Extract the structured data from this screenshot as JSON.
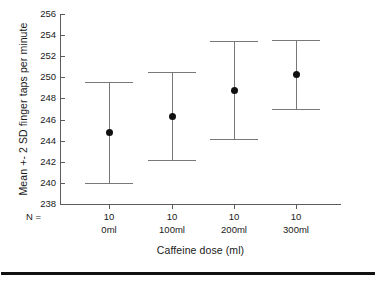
{
  "chart_data": {
    "type": "scatter",
    "title": "",
    "subtitle": "",
    "xlabel": "Caffeine dose (ml)",
    "ylabel": "Mean +- 2 SD finger taps per minute",
    "categories": [
      "0ml",
      "100ml",
      "200ml",
      "300ml"
    ],
    "n_label": "N =",
    "n_values": [
      "10",
      "10",
      "10",
      "10"
    ],
    "ylim": [
      238,
      256
    ],
    "ytick_labels": [
      "238",
      "240",
      "242",
      "244",
      "246",
      "248",
      "250",
      "252",
      "254",
      "256"
    ],
    "ytick_values": [
      238,
      240,
      242,
      244,
      246,
      248,
      250,
      252,
      254,
      256
    ],
    "ytick_step": 2,
    "grid": false,
    "legend": "none",
    "error_kind": "mean +- 2 SD",
    "series": [
      {
        "name": "Mean +- 2 SD finger taps per minute",
        "points": [
          {
            "category": "0ml",
            "mean": 244.8,
            "lower": 240.0,
            "upper": 249.6,
            "n": 10
          },
          {
            "category": "100ml",
            "mean": 246.3,
            "lower": 242.2,
            "upper": 250.5,
            "n": 10
          },
          {
            "category": "200ml",
            "mean": 248.8,
            "lower": 244.2,
            "upper": 253.4,
            "n": 10
          },
          {
            "category": "300ml",
            "mean": 250.3,
            "lower": 247.0,
            "upper": 253.5,
            "n": 10
          }
        ]
      }
    ],
    "colors": {
      "marker": "#101010",
      "error_line": "#787878",
      "axis": "#5c5c5c",
      "text": "#1a1a1a",
      "background": "#ffffff",
      "rule": "#111111"
    }
  }
}
